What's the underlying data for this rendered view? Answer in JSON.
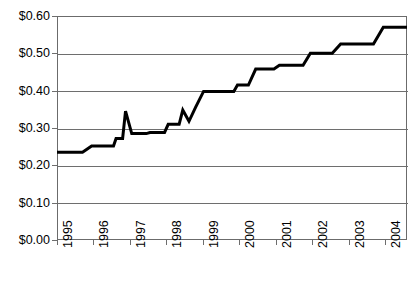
{
  "chart_data": {
    "type": "line",
    "title": "",
    "subtitle": "",
    "xlabel": "",
    "ylabel": "",
    "ylim": [
      0.0,
      0.6
    ],
    "xlim": [
      1995.0,
      2004.6
    ],
    "grid": true,
    "legend_position": "none",
    "y_tick_labels": [
      "$0.60",
      "$0.50",
      "$0.40",
      "$0.30",
      "$0.20",
      "$0.10",
      "$0.00"
    ],
    "y_tick_values": [
      0.6,
      0.5,
      0.4,
      0.3,
      0.2,
      0.1,
      0.0
    ],
    "x_tick_labels": [
      "1995",
      "1996",
      "1997",
      "1998",
      "1999",
      "2000",
      "2001",
      "2002",
      "2003",
      "2004"
    ],
    "x_tick_values": [
      1995,
      1996,
      1997,
      1998,
      1999,
      2000,
      2001,
      2002,
      2003,
      2004
    ],
    "series": [
      {
        "name": "value",
        "color": "#000000",
        "points": [
          {
            "x": 1995.0,
            "y": 0.235
          },
          {
            "x": 1995.7,
            "y": 0.235
          },
          {
            "x": 1995.95,
            "y": 0.252
          },
          {
            "x": 1996.55,
            "y": 0.252
          },
          {
            "x": 1996.62,
            "y": 0.272
          },
          {
            "x": 1996.8,
            "y": 0.272
          },
          {
            "x": 1996.88,
            "y": 0.345
          },
          {
            "x": 1997.05,
            "y": 0.285
          },
          {
            "x": 1997.45,
            "y": 0.285
          },
          {
            "x": 1997.55,
            "y": 0.288
          },
          {
            "x": 1997.95,
            "y": 0.288
          },
          {
            "x": 1998.05,
            "y": 0.31
          },
          {
            "x": 1998.35,
            "y": 0.31
          },
          {
            "x": 1998.45,
            "y": 0.348
          },
          {
            "x": 1998.62,
            "y": 0.318
          },
          {
            "x": 1998.8,
            "y": 0.355
          },
          {
            "x": 1999.02,
            "y": 0.398
          },
          {
            "x": 1999.85,
            "y": 0.398
          },
          {
            "x": 1999.95,
            "y": 0.415
          },
          {
            "x": 2000.25,
            "y": 0.415
          },
          {
            "x": 2000.45,
            "y": 0.458
          },
          {
            "x": 2000.95,
            "y": 0.458
          },
          {
            "x": 2001.1,
            "y": 0.468
          },
          {
            "x": 2001.75,
            "y": 0.468
          },
          {
            "x": 2001.95,
            "y": 0.5
          },
          {
            "x": 2002.55,
            "y": 0.5
          },
          {
            "x": 2002.78,
            "y": 0.525
          },
          {
            "x": 2003.68,
            "y": 0.525
          },
          {
            "x": 2003.95,
            "y": 0.57
          },
          {
            "x": 2004.6,
            "y": 0.57
          }
        ]
      }
    ]
  }
}
